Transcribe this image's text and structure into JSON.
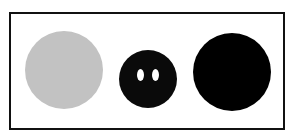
{
  "figure": {
    "frame": {
      "border_color": "#111111",
      "background": "#ffffff"
    },
    "shapes": [
      {
        "name": "gray-circle",
        "color": "#c2c2c2",
        "cx": 64,
        "cy": 70,
        "d": 78
      },
      {
        "name": "face-circle",
        "color": "#0a0a0a",
        "cx": 148,
        "cy": 79,
        "d": 58,
        "eyes": [
          {
            "cx": 140,
            "cy": 75,
            "w": 7,
            "h": 12,
            "color": "#ffffff"
          },
          {
            "cx": 155,
            "cy": 75,
            "w": 7,
            "h": 12,
            "color": "#ffffff"
          }
        ]
      },
      {
        "name": "black-circle",
        "color": "#000000",
        "cx": 232,
        "cy": 72,
        "d": 78
      }
    ]
  }
}
